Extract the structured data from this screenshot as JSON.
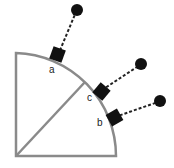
{
  "diagram": {
    "type": "quarter-circle with tangential pendulum masses",
    "colors": {
      "outline": "#8a8a8a",
      "block": "#111111",
      "bob": "#111111",
      "string": "#222222"
    },
    "points": [
      {
        "label": "a"
      },
      {
        "label": "c"
      },
      {
        "label": "b"
      }
    ]
  }
}
